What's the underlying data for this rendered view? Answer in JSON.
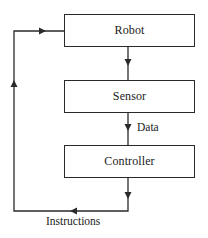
{
  "diagram": {
    "type": "feedback-loop block diagram",
    "nodes": [
      {
        "id": "robot",
        "label": "Robot"
      },
      {
        "id": "sensor",
        "label": "Sensor"
      },
      {
        "id": "controller",
        "label": "Controller"
      }
    ],
    "edges": [
      {
        "from": "robot",
        "to": "sensor",
        "label": ""
      },
      {
        "from": "sensor",
        "to": "controller",
        "label": "Data"
      },
      {
        "from": "controller",
        "to": "robot",
        "label": "Instructions"
      }
    ],
    "edge_labels": {
      "data": "Data",
      "instructions": "Instructions"
    },
    "colors": {
      "line": "#2a2a2a",
      "background": "#ffffff",
      "text": "#1a1a1a"
    }
  }
}
